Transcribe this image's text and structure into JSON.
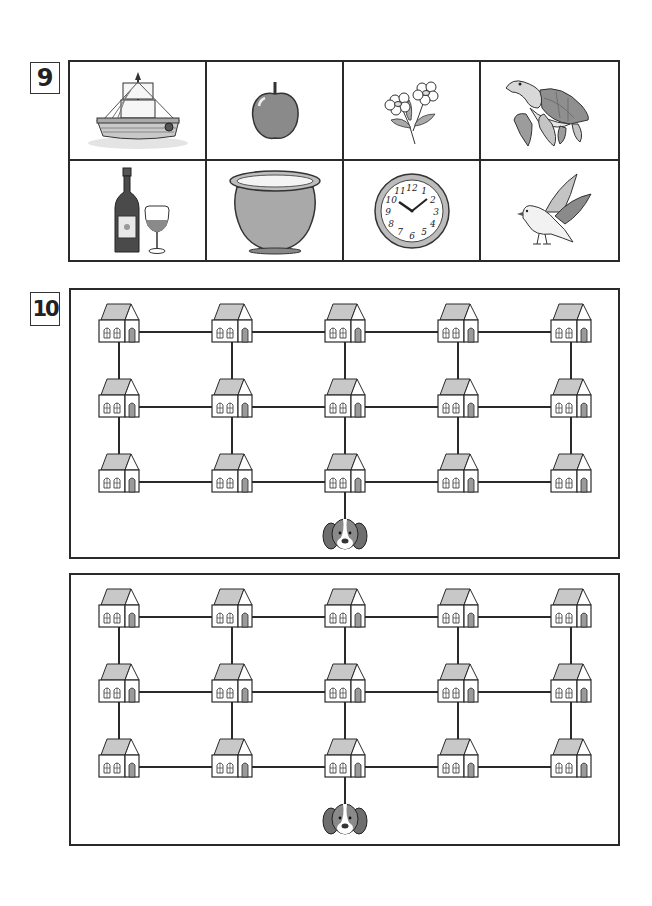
{
  "worksheet": {
    "exercises": [
      {
        "number": "9",
        "pictures": [
          {
            "name": "sailing-ship",
            "icon": "ship-icon"
          },
          {
            "name": "apple",
            "icon": "apple-icon"
          },
          {
            "name": "flowers",
            "icon": "flowers-icon"
          },
          {
            "name": "sea-turtle",
            "icon": "turtle-icon"
          },
          {
            "name": "wine-bottle-and-glass",
            "icon": "wine-icon"
          },
          {
            "name": "flower-pot",
            "icon": "pot-icon"
          },
          {
            "name": "wall-clock",
            "icon": "clock-icon"
          },
          {
            "name": "bird",
            "icon": "bird-icon"
          }
        ],
        "clock_numerals": [
          "12",
          "1",
          "2",
          "3",
          "4",
          "5",
          "6",
          "7",
          "8",
          "9",
          "10",
          "11"
        ],
        "clock_time": "10:10"
      },
      {
        "number": "10",
        "mazes": [
          {
            "rows": 3,
            "cols": 5,
            "start": {
              "row": 2,
              "col": 2
            },
            "start_icon": "dog-icon",
            "node_icon": "house-icon",
            "connections": "all-adjacent"
          },
          {
            "rows": 3,
            "cols": 5,
            "start": {
              "row": 2,
              "col": 2
            },
            "start_icon": "dog-icon",
            "node_icon": "house-icon",
            "connections": "all-adjacent"
          }
        ]
      }
    ]
  },
  "colors": {
    "ink": "#2a2a2a",
    "fill_gray": "#9a9a9a",
    "light_gray": "#c8c8c8",
    "paper": "#ffffff"
  }
}
